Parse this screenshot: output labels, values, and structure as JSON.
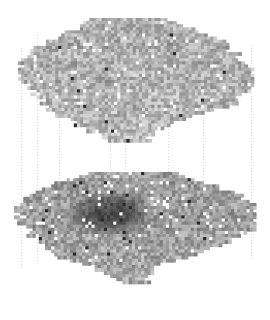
{
  "figure": {
    "title": "",
    "background_color": "#ffffff",
    "width": 270,
    "height": 320
  },
  "chart_data": {
    "type": "heatmap",
    "title": "",
    "subtitle": "",
    "xlabel": "",
    "ylabel": "",
    "grid": false,
    "legend": "none",
    "colormap": "grays",
    "value_range": [
      0,
      1
    ],
    "layers": [
      {
        "name": "upper-layer",
        "index": 0,
        "origin": [
          18,
          18
        ],
        "cell_size": 3.1,
        "cols": 76,
        "rows": 38,
        "mean_value": 0.7,
        "min_value": 0.18,
        "max_value": 1.0,
        "dark_cluster": false,
        "shape_rows": [
          {
            "row": 0,
            "start": 24,
            "end": 46,
            "tone": 0.72
          },
          {
            "row": 1,
            "start": 20,
            "end": 52,
            "tone": 0.7
          },
          {
            "row": 2,
            "start": 16,
            "end": 58,
            "tone": 0.68
          },
          {
            "row": 3,
            "start": 12,
            "end": 62,
            "tone": 0.71
          },
          {
            "row": 4,
            "start": 8,
            "end": 66,
            "tone": 0.66
          },
          {
            "row": 5,
            "start": 4,
            "end": 68,
            "tone": 0.69
          },
          {
            "row": 6,
            "start": 2,
            "end": 70,
            "tone": 0.73
          },
          {
            "row": 7,
            "start": 1,
            "end": 72,
            "tone": 0.67
          },
          {
            "row": 8,
            "start": 0,
            "end": 74,
            "tone": 0.7
          },
          {
            "row": 9,
            "start": 0,
            "end": 76,
            "tone": 0.72
          },
          {
            "row": 10,
            "start": 2,
            "end": 76,
            "tone": 0.68
          },
          {
            "row": 11,
            "start": 4,
            "end": 74,
            "tone": 0.7
          },
          {
            "row": 12,
            "start": 6,
            "end": 72,
            "tone": 0.74
          },
          {
            "row": 13,
            "start": 8,
            "end": 70,
            "tone": 0.71
          },
          {
            "row": 14,
            "start": 10,
            "end": 66,
            "tone": 0.69
          },
          {
            "row": 15,
            "start": 12,
            "end": 60,
            "tone": 0.72
          },
          {
            "row": 16,
            "start": 16,
            "end": 54,
            "tone": 0.7
          },
          {
            "row": 17,
            "start": 20,
            "end": 48,
            "tone": 0.73
          },
          {
            "row": 18,
            "start": 24,
            "end": 44,
            "tone": 0.71
          },
          {
            "row": 19,
            "start": 28,
            "end": 42,
            "tone": 0.74
          }
        ]
      },
      {
        "name": "lower-layer",
        "index": 1,
        "origin": [
          14,
          172
        ],
        "cell_size": 3.1,
        "cols": 78,
        "rows": 44,
        "mean_value": 0.62,
        "min_value": 0.1,
        "max_value": 1.0,
        "dark_cluster": true,
        "dark_cluster_center": [
          108,
          212
        ],
        "dark_cluster_radius_x": 46,
        "dark_cluster_radius_y": 24,
        "dark_cluster_value": 0.28,
        "shape_rows": [
          {
            "row": 0,
            "start": 22,
            "end": 52,
            "tone": 0.64
          },
          {
            "row": 1,
            "start": 18,
            "end": 58,
            "tone": 0.62
          },
          {
            "row": 2,
            "start": 12,
            "end": 64,
            "tone": 0.6
          },
          {
            "row": 3,
            "start": 8,
            "end": 70,
            "tone": 0.63
          },
          {
            "row": 4,
            "start": 4,
            "end": 74,
            "tone": 0.61
          },
          {
            "row": 5,
            "start": 2,
            "end": 77,
            "tone": 0.64
          },
          {
            "row": 6,
            "start": 0,
            "end": 78,
            "tone": 0.62
          },
          {
            "row": 7,
            "start": 0,
            "end": 78,
            "tone": 0.6
          },
          {
            "row": 8,
            "start": 2,
            "end": 78,
            "tone": 0.63
          },
          {
            "row": 9,
            "start": 4,
            "end": 76,
            "tone": 0.61
          },
          {
            "row": 10,
            "start": 6,
            "end": 72,
            "tone": 0.64
          },
          {
            "row": 11,
            "start": 8,
            "end": 68,
            "tone": 0.62
          },
          {
            "row": 12,
            "start": 10,
            "end": 62,
            "tone": 0.65
          },
          {
            "row": 13,
            "start": 14,
            "end": 56,
            "tone": 0.63
          },
          {
            "row": 14,
            "start": 18,
            "end": 50,
            "tone": 0.66
          },
          {
            "row": 15,
            "start": 24,
            "end": 46,
            "tone": 0.64
          },
          {
            "row": 16,
            "start": 30,
            "end": 44,
            "tone": 0.67
          },
          {
            "row": 17,
            "start": 34,
            "end": 42,
            "tone": 0.65
          }
        ]
      }
    ],
    "connectors": {
      "style": "dotted",
      "color": "#d9d9d9",
      "dot_size": 1,
      "dot_spacing": 3,
      "count": 8,
      "x_positions": [
        21,
        37,
        59,
        110,
        125,
        168,
        203,
        251
      ],
      "y_tops": [
        48,
        35,
        82,
        100,
        88,
        90,
        42,
        45
      ],
      "y_bottoms": [
        268,
        262,
        230,
        250,
        240,
        205,
        185,
        258
      ]
    }
  }
}
